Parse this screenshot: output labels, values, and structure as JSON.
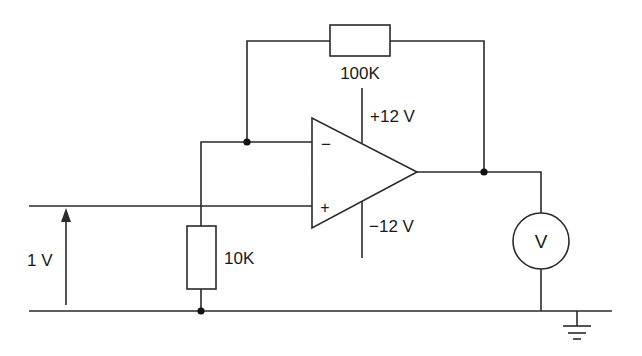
{
  "diagram": {
    "type": "circuit-schematic",
    "components": {
      "feedback_resistor": {
        "label": "100K"
      },
      "ground_resistor": {
        "label": "10K"
      },
      "op_amp": {
        "inverting_input": "−",
        "non_inverting_input": "+",
        "positive_supply": "+12 V",
        "negative_supply": "−12 V"
      },
      "input_source": {
        "label": "1 V"
      },
      "voltmeter": {
        "label": "V"
      },
      "ground": {
        "symbol": "ground-icon"
      }
    },
    "colors": {
      "line": "#2a2a2a",
      "background": "#ffffff"
    }
  }
}
